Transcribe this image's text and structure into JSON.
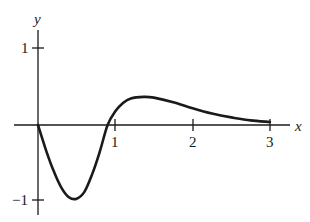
{
  "chart_data": {
    "type": "line",
    "title": "",
    "xlabel": "x",
    "ylabel": "y",
    "x_ticks": [
      "1",
      "2",
      "3"
    ],
    "y_ticks": [
      "1",
      "-1"
    ],
    "xlim": [
      0,
      3
    ],
    "ylim": [
      -1.05,
      1.3
    ],
    "grid": false,
    "legend": null,
    "series": [
      {
        "name": "curve",
        "x": [
          0,
          0.1,
          0.2,
          0.3,
          0.4,
          0.5,
          0.6,
          0.7,
          0.8,
          0.9,
          1.0,
          1.1,
          1.2,
          1.37,
          1.5,
          1.75,
          2.0,
          2.25,
          2.5,
          2.75,
          3.0
        ],
        "y": [
          0,
          -0.32,
          -0.6,
          -0.82,
          -0.95,
          -0.97,
          -0.88,
          -0.65,
          -0.35,
          0.0,
          0.18,
          0.29,
          0.35,
          0.37,
          0.36,
          0.3,
          0.22,
          0.15,
          0.1,
          0.06,
          0.04
        ]
      }
    ]
  },
  "labels": {
    "x_axis": "x",
    "y_axis": "y",
    "tick_x1": "1",
    "tick_x2": "2",
    "tick_x3": "3",
    "tick_y1": "1",
    "tick_ym1": "−1"
  }
}
